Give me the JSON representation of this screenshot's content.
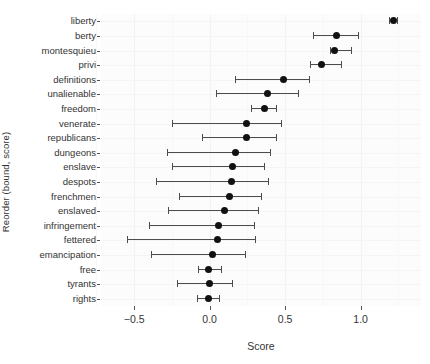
{
  "chart_data": {
    "type": "scatter",
    "title": "",
    "xlabel": "Score",
    "ylabel": "Reorder (bound, score)",
    "xlim": [
      -0.72,
      1.4
    ],
    "xticks": [
      -0.5,
      0.0,
      0.5,
      1.0
    ],
    "xticklabels": [
      "−0.5",
      "0.0",
      "0.5",
      "1.0"
    ],
    "grid": true,
    "legend": null,
    "orientation": "horizontal",
    "marker": "filled-circle",
    "errorbar": "horizontal-interval-with-caps",
    "categories": [
      "liberty",
      "berty",
      "montesquieu",
      "privi",
      "definitions",
      "unalienable",
      "freedom",
      "venerate",
      "republicans",
      "dungeons",
      "enslave",
      "despots",
      "frenchmen",
      "enslaved",
      "infringement",
      "fettered",
      "emancipation",
      "free",
      "tyrants",
      "rights"
    ],
    "points": [
      {
        "label": "liberty",
        "score": 1.215,
        "low": 1.19,
        "high": 1.24
      },
      {
        "label": "berty",
        "score": 0.84,
        "low": 0.684,
        "high": 0.981
      },
      {
        "label": "montesquieu",
        "score": 0.829,
        "low": 0.797,
        "high": 0.937
      },
      {
        "label": "privi",
        "score": 0.741,
        "low": 0.665,
        "high": 0.867
      },
      {
        "label": "definitions",
        "score": 0.487,
        "low": 0.171,
        "high": 0.658
      },
      {
        "label": "unalienable",
        "score": 0.386,
        "low": 0.044,
        "high": 0.582
      },
      {
        "label": "freedom",
        "score": 0.361,
        "low": 0.272,
        "high": 0.437
      },
      {
        "label": "venerate",
        "score": 0.247,
        "low": -0.247,
        "high": 0.475
      },
      {
        "label": "republicans",
        "score": 0.247,
        "low": -0.051,
        "high": 0.437
      },
      {
        "label": "dungeons",
        "score": 0.171,
        "low": -0.285,
        "high": 0.399
      },
      {
        "label": "enslave",
        "score": 0.152,
        "low": -0.247,
        "high": 0.361
      },
      {
        "label": "despots",
        "score": 0.146,
        "low": -0.354,
        "high": 0.386
      },
      {
        "label": "frenchmen",
        "score": 0.133,
        "low": -0.203,
        "high": 0.342
      },
      {
        "label": "enslaved",
        "score": 0.101,
        "low": -0.278,
        "high": 0.323
      },
      {
        "label": "infringement",
        "score": 0.057,
        "low": -0.405,
        "high": 0.291
      },
      {
        "label": "fettered",
        "score": 0.051,
        "low": -0.551,
        "high": 0.297
      },
      {
        "label": "emancipation",
        "score": 0.019,
        "low": -0.386,
        "high": 0.234
      },
      {
        "label": "free",
        "score": -0.006,
        "low": -0.076,
        "high": 0.076
      },
      {
        "label": "tyrants",
        "score": 0.0,
        "low": -0.215,
        "high": 0.146
      },
      {
        "label": "rights",
        "score": -0.006,
        "low": -0.082,
        "high": 0.063
      }
    ]
  }
}
